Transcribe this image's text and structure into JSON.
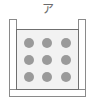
{
  "figure": {
    "label": "ア",
    "label_name": "figure-label-a",
    "container": {
      "shape": "open-top-u-shaped-container",
      "wall_color": "#8a8a8a",
      "fill_color": "#ffffff"
    },
    "inner_box": {
      "fill_color": "#f2f2f2",
      "border_color": "#6f6f6f"
    },
    "particles": {
      "color": "#9a9a9a",
      "rows": 3,
      "columns": 3,
      "count": 9,
      "items": [
        {
          "id": "particle-r1c1"
        },
        {
          "id": "particle-r1c2"
        },
        {
          "id": "particle-r1c3"
        },
        {
          "id": "particle-r2c1"
        },
        {
          "id": "particle-r2c2"
        },
        {
          "id": "particle-r2c3"
        },
        {
          "id": "particle-r3c1"
        },
        {
          "id": "particle-r3c2"
        },
        {
          "id": "particle-r3c3"
        }
      ]
    }
  }
}
